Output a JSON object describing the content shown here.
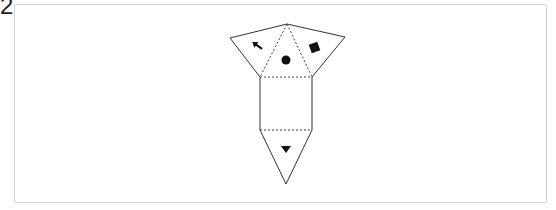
{
  "question": {
    "number": "2"
  },
  "diagram": {
    "type": "net",
    "faces": [
      {
        "id": "top-center-triangle",
        "symbol": "circle"
      },
      {
        "id": "left-flap",
        "symbol": "arrow"
      },
      {
        "id": "right-flap",
        "symbol": "square"
      },
      {
        "id": "center-square",
        "symbol": ""
      },
      {
        "id": "bottom-triangle",
        "symbol": "triangle-down"
      }
    ],
    "colors": {
      "stroke": "#333333",
      "fill": "#111111",
      "frame": "#d4d4d4"
    }
  }
}
